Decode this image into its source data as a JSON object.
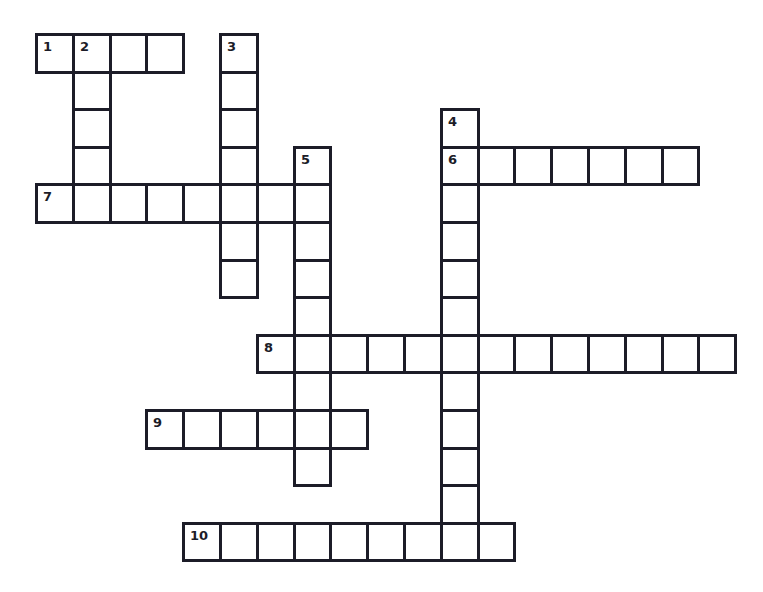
{
  "puzzle": {
    "grid_origin": {
      "x": 35,
      "y": 33
    },
    "cell_size": {
      "w": 36.8,
      "h": 37.6
    },
    "border_color": "#1c1c28",
    "background_color": "#ffffff",
    "entries": [
      {
        "number": "1",
        "direction": "across",
        "row": 0,
        "col": 0,
        "length": 4
      },
      {
        "number": "2",
        "direction": "down",
        "row": 0,
        "col": 1,
        "length": 4
      },
      {
        "number": "3",
        "direction": "down",
        "row": 0,
        "col": 5,
        "length": 7
      },
      {
        "number": "4",
        "direction": "down",
        "row": 2,
        "col": 11,
        "length": 12
      },
      {
        "number": "5",
        "direction": "down",
        "row": 3,
        "col": 7,
        "length": 9
      },
      {
        "number": "6",
        "direction": "across",
        "row": 3,
        "col": 11,
        "length": 7
      },
      {
        "number": "7",
        "direction": "across",
        "row": 4,
        "col": 0,
        "length": 8
      },
      {
        "number": "8",
        "direction": "across",
        "row": 8,
        "col": 6,
        "length": 13
      },
      {
        "number": "9",
        "direction": "across",
        "row": 10,
        "col": 3,
        "length": 6
      },
      {
        "number": "10",
        "direction": "across",
        "row": 13,
        "col": 4,
        "length": 9
      }
    ]
  }
}
